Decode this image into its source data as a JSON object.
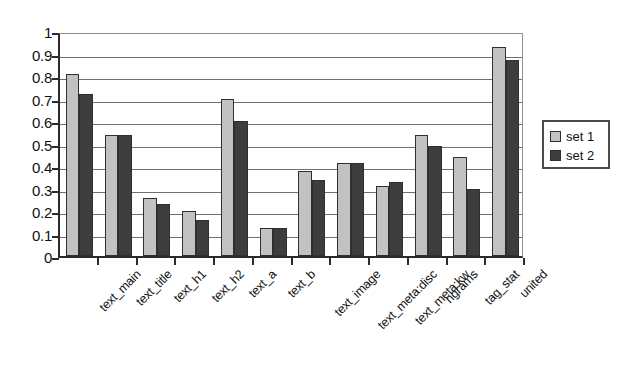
{
  "chart_data": {
    "type": "bar",
    "title": "",
    "xlabel": "",
    "ylabel": "",
    "ylim": [
      0,
      1
    ],
    "ytick_labels": [
      "1",
      "0.9",
      "0.8",
      "0.7",
      "0.6",
      "0.5",
      "0.4",
      "0.3",
      "0.2",
      "0.1",
      "0"
    ],
    "ytick_values": [
      1,
      0.9,
      0.8,
      0.7,
      0.6,
      0.5,
      0.4,
      0.3,
      0.2,
      0.1,
      0
    ],
    "grid": true,
    "legend_position": "right",
    "categories": [
      "text_main",
      "text_title",
      "text_h1",
      "text_h2",
      "text_a",
      "text_b",
      "text_image",
      "text_meta:disc",
      "text_meta:kw",
      "ngrams",
      "tag_stat",
      "united"
    ],
    "series": [
      {
        "name": "set 1",
        "color": "#c2c2c2",
        "values": [
          0.81,
          0.54,
          0.26,
          0.2,
          0.7,
          0.125,
          0.38,
          0.415,
          0.31,
          0.54,
          0.44,
          0.93
        ]
      },
      {
        "name": "set 2",
        "color": "#3d3d3d",
        "values": [
          0.72,
          0.54,
          0.23,
          0.16,
          0.6,
          0.125,
          0.34,
          0.415,
          0.33,
          0.49,
          0.3,
          0.87
        ]
      }
    ]
  },
  "legend": {
    "entries": [
      {
        "label": "set 1",
        "swatch": "#c2c2c2"
      },
      {
        "label": "set 2",
        "swatch": "#3d3d3d"
      }
    ]
  }
}
